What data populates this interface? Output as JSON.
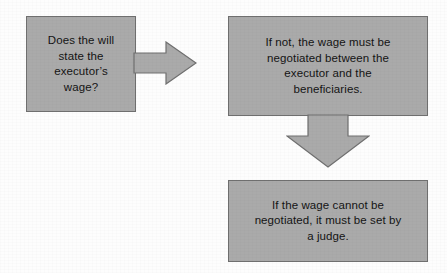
{
  "diagram": {
    "background_color": "#fdfdfd",
    "node_fill_color": "#aaaaaa",
    "node_border_color": "#6f6f6f",
    "text_color": "#141414",
    "nodes": [
      {
        "id": "decision",
        "label": "Does the will state the executor’s wage?",
        "lines": "Does the will\nstate the\nexecutor’s\nwage?",
        "shape": "rectangle"
      },
      {
        "id": "negotiate",
        "label": "If not, the wage must be negotiated between the executor and the beneficiaries.",
        "lines": "If not, the wage must be\nnegotiated between the\nexecutor and the\nbeneficiaries.",
        "shape": "rectangle"
      },
      {
        "id": "judge",
        "label": "If the wage cannot be negotiated, it must be set by a judge.",
        "lines": "If the wage cannot be\nnegotiated, it must be set by\na judge.",
        "shape": "rectangle"
      }
    ],
    "connectors": [
      {
        "id": "decision-to-negotiate",
        "direction": "right",
        "from": "decision",
        "to": "negotiate",
        "fill_color": "#aaaaaa",
        "border_color": "#6f6f6f"
      },
      {
        "id": "negotiate-to-judge",
        "direction": "down",
        "from": "negotiate",
        "to": "judge",
        "fill_color": "#aaaaaa",
        "border_color": "#6f6f6f"
      }
    ]
  }
}
